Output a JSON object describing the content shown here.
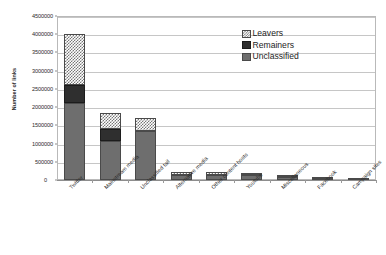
{
  "chart_data": {
    "type": "bar",
    "stacked": true,
    "title": "",
    "xlabel": "",
    "ylabel": "Number of links",
    "ylim": [
      0,
      4500000
    ],
    "ytick_step": 500000,
    "ytick_labels": [
      "0",
      "500000",
      "1000000",
      "1500000",
      "2000000",
      "2500000",
      "3000000",
      "3500000",
      "4000000",
      "4500000"
    ],
    "grid": true,
    "legend_position": "top-right",
    "categories": [
      "Twitter",
      "Mainstream media",
      "Unclassified tail",
      "Alternative media",
      "Other content hosts",
      "Youtube",
      "Miscellaneous",
      "Facebook",
      "Campaign sites"
    ],
    "series": [
      {
        "name": "Unclassified",
        "color": "#6e6e6e",
        "pattern": "solid-gray",
        "values": [
          2100000,
          1070000,
          1340000,
          150000,
          150000,
          130000,
          85000,
          40000,
          8000
        ]
      },
      {
        "name": "Remainers",
        "color": "#2f2f2f",
        "pattern": "solid-dark",
        "values": [
          500000,
          330000,
          0,
          0,
          0,
          0,
          0,
          0,
          0
        ]
      },
      {
        "name": "Leavers",
        "color": "#777777",
        "pattern": "checkered",
        "values": [
          1400000,
          450000,
          360000,
          70000,
          70000,
          60000,
          35000,
          25000,
          7000
        ]
      }
    ],
    "totals": [
      4000000,
      1850000,
      1700000,
      220000,
      220000,
      190000,
      120000,
      65000,
      15000
    ]
  },
  "legend": {
    "items": [
      {
        "label": "Leavers",
        "swatch": "checkered-swatch"
      },
      {
        "label": "Remainers",
        "swatch": "dark-swatch"
      },
      {
        "label": "Unclassified",
        "swatch": "gray-swatch"
      }
    ]
  },
  "axis": {
    "y_title": "Number of links",
    "zero_label": "0"
  }
}
